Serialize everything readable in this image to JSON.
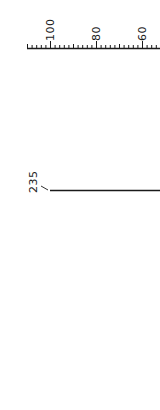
{
  "figure": {
    "scale": {
      "orientation": "horizontal",
      "tick_labels": [
        "100",
        "80",
        "60"
      ],
      "label_positions_px": [
        50,
        96,
        143
      ],
      "minor_ticks_per_major": 10,
      "color": "#1a1a1a"
    },
    "callout": {
      "label": "235",
      "line_color": "#1a1a1a"
    }
  }
}
